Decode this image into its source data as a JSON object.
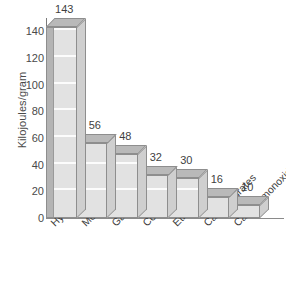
{
  "chart_data": {
    "type": "bar",
    "title": "",
    "subtitle": "",
    "xlabel": "",
    "ylabel": "Kilojoules/gram",
    "ylim": [
      0,
      150
    ],
    "ytick_labels": [
      "140",
      "120",
      "100",
      "80",
      "60",
      "40",
      "20",
      "0"
    ],
    "ytick_values": [
      140,
      120,
      100,
      80,
      60,
      40,
      20,
      0
    ],
    "grid": "horizontal-white-lines-on-bars",
    "legend": "none",
    "style": "3d-isometric-bars",
    "categories": [
      "Hydrogen",
      "Methane",
      "Gasoline",
      "Coal",
      "Ethanol",
      "Carbohydrates",
      "Carbon monoxide"
    ],
    "values": [
      143,
      56,
      48,
      32,
      30,
      16,
      10
    ],
    "value_labels": [
      "143",
      "56",
      "48",
      "32",
      "30",
      "16",
      "10"
    ],
    "colors": {
      "bar_front": "#e2e2e2",
      "bar_top": "#b9b9b9",
      "bar_side": "#cfcfcf",
      "bar_outline": "#8e8e8e",
      "gridline": "#ffffff",
      "axis": "#7b7b7b",
      "text": "#3f3f3f",
      "background": "#ffffff"
    }
  }
}
